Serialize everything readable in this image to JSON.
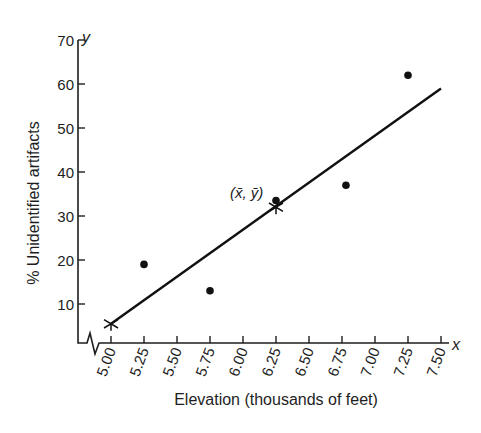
{
  "chart_data": {
    "type": "scatter",
    "title": "",
    "xlabel": "Elevation (thousands of feet)",
    "ylabel": "% Unidentified artifacts",
    "x_axis_letter": "x",
    "y_axis_letter": "y",
    "xlim": [
      5.0,
      7.5
    ],
    "ylim": [
      0,
      70
    ],
    "x_ticks": [
      "5.00",
      "5.25",
      "5.50",
      "5.75",
      "6.00",
      "6.25",
      "6.50",
      "6.75",
      "7.00",
      "7.25",
      "7.50"
    ],
    "y_ticks": [
      "10",
      "20",
      "30",
      "40",
      "50",
      "60",
      "70"
    ],
    "axis_break": "x-axis break near origin",
    "grid": false,
    "legend": null,
    "series": [
      {
        "name": "Observed data",
        "marker": "filled-circle",
        "points": [
          {
            "x": 5.25,
            "y": 19
          },
          {
            "x": 5.75,
            "y": 13
          },
          {
            "x": 6.25,
            "y": 33.5
          },
          {
            "x": 6.78,
            "y": 37
          },
          {
            "x": 7.25,
            "y": 62
          }
        ]
      },
      {
        "name": "Least-squares regression line",
        "type": "line",
        "points": [
          {
            "x": 5.0,
            "y": 5.5
          },
          {
            "x": 7.5,
            "y": 59
          }
        ]
      }
    ],
    "markers": [
      {
        "label": "start",
        "marker": "x-cross",
        "x": 5.0,
        "y": 5.5
      },
      {
        "label": "(x̄, ȳ)",
        "marker": "x-cross",
        "x": 6.25,
        "y": 32
      }
    ],
    "annotations": [
      {
        "text": "(x̄, ȳ)",
        "x": 6.25,
        "y": 32
      }
    ]
  }
}
